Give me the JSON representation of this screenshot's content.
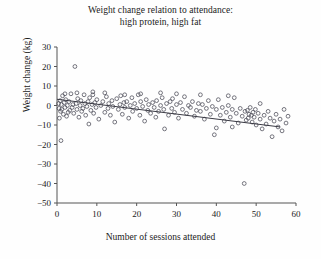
{
  "chart_data": {
    "type": "scatter",
    "title": "Weight change relation to attendance:\nhigh protein, high fat",
    "title_line1": "Weight change relation to attendance:",
    "title_line2": "high protein, high fat",
    "xlabel": "Number of sessions attended",
    "ylabel": "Weight change (kg)",
    "xlim": [
      0,
      60
    ],
    "ylim": [
      -50,
      30
    ],
    "xticks": [
      0,
      10,
      20,
      30,
      40,
      50,
      60
    ],
    "yticks": [
      30,
      20,
      10,
      0,
      -10,
      -20,
      -30,
      -40,
      -50
    ],
    "xtick_labels": [
      "0",
      "10",
      "20",
      "30",
      "40",
      "50",
      "60"
    ],
    "ytick_labels": [
      "30",
      "20",
      "10",
      "0",
      "-10",
      "-20",
      "-30",
      "-40",
      "-50"
    ],
    "grid": false,
    "legend": false,
    "marker": "open-circle",
    "marker_color": "#4a4a56",
    "line_color": "#3a3a44",
    "trendline": {
      "type": "linear-fit",
      "x_start": 0,
      "y_start": 3.2,
      "x_end": 56,
      "y_end": -11.0,
      "slope": -0.254,
      "intercept": 3.2
    },
    "points": [
      [
        0.4,
        1.0
      ],
      [
        0.5,
        -1.5
      ],
      [
        0.6,
        -6.5
      ],
      [
        0.8,
        2.5
      ],
      [
        0.9,
        -3.0
      ],
      [
        1.0,
        -18.0
      ],
      [
        1.1,
        0.5
      ],
      [
        1.2,
        -2.0
      ],
      [
        1.4,
        5.0
      ],
      [
        1.6,
        -4.5
      ],
      [
        1.8,
        1.5
      ],
      [
        2.0,
        -1.0
      ],
      [
        2.2,
        3.0
      ],
      [
        2.4,
        -5.5
      ],
      [
        2.6,
        0.0
      ],
      [
        2.8,
        -3.5
      ],
      [
        3.0,
        2.0
      ],
      [
        3.2,
        -2.5
      ],
      [
        3.5,
        6.0
      ],
      [
        3.8,
        -1.0
      ],
      [
        4.0,
        0.5
      ],
      [
        4.2,
        -4.0
      ],
      [
        4.5,
        20.0
      ],
      [
        4.8,
        1.0
      ],
      [
        5.0,
        -2.0
      ],
      [
        5.2,
        3.5
      ],
      [
        5.5,
        -6.0
      ],
      [
        5.8,
        0.0
      ],
      [
        6.0,
        2.5
      ],
      [
        6.2,
        -3.0
      ],
      [
        6.5,
        -1.5
      ],
      [
        6.8,
        5.5
      ],
      [
        7.0,
        1.0
      ],
      [
        7.2,
        -5.0
      ],
      [
        7.5,
        -0.5
      ],
      [
        7.8,
        2.0
      ],
      [
        8.0,
        -9.5
      ],
      [
        8.2,
        4.0
      ],
      [
        8.5,
        -2.5
      ],
      [
        8.8,
        0.5
      ],
      [
        9.0,
        5.5
      ],
      [
        9.2,
        -4.0
      ],
      [
        9.5,
        1.5
      ],
      [
        9.8,
        -1.0
      ],
      [
        10.0,
        3.0
      ],
      [
        10.5,
        -7.0
      ],
      [
        11.0,
        0.0
      ],
      [
        11.5,
        2.0
      ],
      [
        12.0,
        -3.5
      ],
      [
        12.4,
        4.5
      ],
      [
        12.8,
        -1.5
      ],
      [
        13.0,
        1.0
      ],
      [
        13.4,
        -5.0
      ],
      [
        13.8,
        2.5
      ],
      [
        14.0,
        -0.5
      ],
      [
        14.5,
        -8.5
      ],
      [
        15.0,
        3.5
      ],
      [
        15.4,
        -2.0
      ],
      [
        15.8,
        0.5
      ],
      [
        16.0,
        5.0
      ],
      [
        16.4,
        -4.5
      ],
      [
        16.8,
        1.5
      ],
      [
        17.0,
        -1.0
      ],
      [
        17.5,
        2.0
      ],
      [
        18.0,
        -6.5
      ],
      [
        18.4,
        0.0
      ],
      [
        18.8,
        4.0
      ],
      [
        19.0,
        -3.0
      ],
      [
        19.5,
        1.0
      ],
      [
        20.0,
        -1.5
      ],
      [
        20.4,
        5.5
      ],
      [
        20.8,
        -5.0
      ],
      [
        21.0,
        2.0
      ],
      [
        21.5,
        -0.5
      ],
      [
        22.0,
        -8.0
      ],
      [
        22.4,
        3.0
      ],
      [
        22.8,
        -2.5
      ],
      [
        23.0,
        0.5
      ],
      [
        23.5,
        -4.0
      ],
      [
        24.0,
        1.5
      ],
      [
        24.4,
        -1.0
      ],
      [
        24.8,
        -6.0
      ],
      [
        25.0,
        2.5
      ],
      [
        25.5,
        -3.0
      ],
      [
        26.0,
        0.0
      ],
      [
        26.4,
        4.0
      ],
      [
        26.8,
        -2.0
      ],
      [
        27.0,
        -12.0
      ],
      [
        27.5,
        1.0
      ],
      [
        28.0,
        -5.0
      ],
      [
        28.4,
        2.0
      ],
      [
        28.8,
        -1.5
      ],
      [
        29.0,
        3.5
      ],
      [
        29.5,
        -3.5
      ],
      [
        30.0,
        0.5
      ],
      [
        30.5,
        -6.5
      ],
      [
        31.0,
        1.5
      ],
      [
        31.5,
        -2.0
      ],
      [
        32.0,
        4.5
      ],
      [
        32.5,
        -4.0
      ],
      [
        33.0,
        0.0
      ],
      [
        33.5,
        -1.0
      ],
      [
        34.0,
        2.0
      ],
      [
        34.5,
        -5.5
      ],
      [
        35.0,
        -2.5
      ],
      [
        35.5,
        1.0
      ],
      [
        36.0,
        -3.0
      ],
      [
        36.5,
        0.5
      ],
      [
        37.0,
        -7.0
      ],
      [
        37.5,
        -1.5
      ],
      [
        38.0,
        2.5
      ],
      [
        38.5,
        -4.5
      ],
      [
        39.0,
        -0.5
      ],
      [
        39.5,
        -15.0
      ],
      [
        40.0,
        -2.0
      ],
      [
        40.5,
        3.0
      ],
      [
        41.0,
        -5.0
      ],
      [
        41.5,
        -1.0
      ],
      [
        42.0,
        -8.0
      ],
      [
        42.5,
        -3.5
      ],
      [
        43.0,
        0.0
      ],
      [
        43.5,
        -6.0
      ],
      [
        44.0,
        -2.0
      ],
      [
        44.5,
        4.0
      ],
      [
        45.0,
        -4.0
      ],
      [
        45.5,
        -9.0
      ],
      [
        46.0,
        -1.5
      ],
      [
        46.5,
        -5.5
      ],
      [
        47.0,
        -40.0
      ],
      [
        47.2,
        -3.0
      ],
      [
        47.5,
        -7.5
      ],
      [
        47.8,
        -2.5
      ],
      [
        48.0,
        -6.5
      ],
      [
        48.2,
        -4.5
      ],
      [
        48.5,
        -1.0
      ],
      [
        48.8,
        -5.0
      ],
      [
        49.0,
        -8.5
      ],
      [
        49.2,
        -3.5
      ],
      [
        49.5,
        -6.0
      ],
      [
        49.8,
        -2.0
      ],
      [
        50.0,
        -10.0
      ],
      [
        50.5,
        -4.0
      ],
      [
        51.0,
        -7.0
      ],
      [
        51.5,
        -12.0
      ],
      [
        52.0,
        -5.0
      ],
      [
        52.5,
        -9.5
      ],
      [
        53.0,
        -3.0
      ],
      [
        53.5,
        -6.5
      ],
      [
        54.0,
        -16.0
      ],
      [
        54.5,
        -8.0
      ],
      [
        55.0,
        -4.5
      ],
      [
        55.5,
        -11.0
      ],
      [
        56.0,
        -7.0
      ],
      [
        56.5,
        -13.0
      ],
      [
        57.0,
        -2.0
      ],
      [
        57.5,
        -9.0
      ],
      [
        58.0,
        -5.5
      ],
      [
        43.0,
        5.0
      ],
      [
        36.0,
        5.5
      ],
      [
        30.0,
        6.0
      ],
      [
        26.0,
        6.5
      ],
      [
        21.0,
        6.0
      ],
      [
        17.0,
        5.5
      ],
      [
        12.0,
        6.5
      ],
      [
        9.0,
        7.0
      ],
      [
        5.0,
        6.5
      ],
      [
        2.0,
        6.0
      ],
      [
        51.0,
        1.0
      ],
      [
        44.0,
        -11.0
      ],
      [
        40.0,
        -11.5
      ]
    ]
  }
}
